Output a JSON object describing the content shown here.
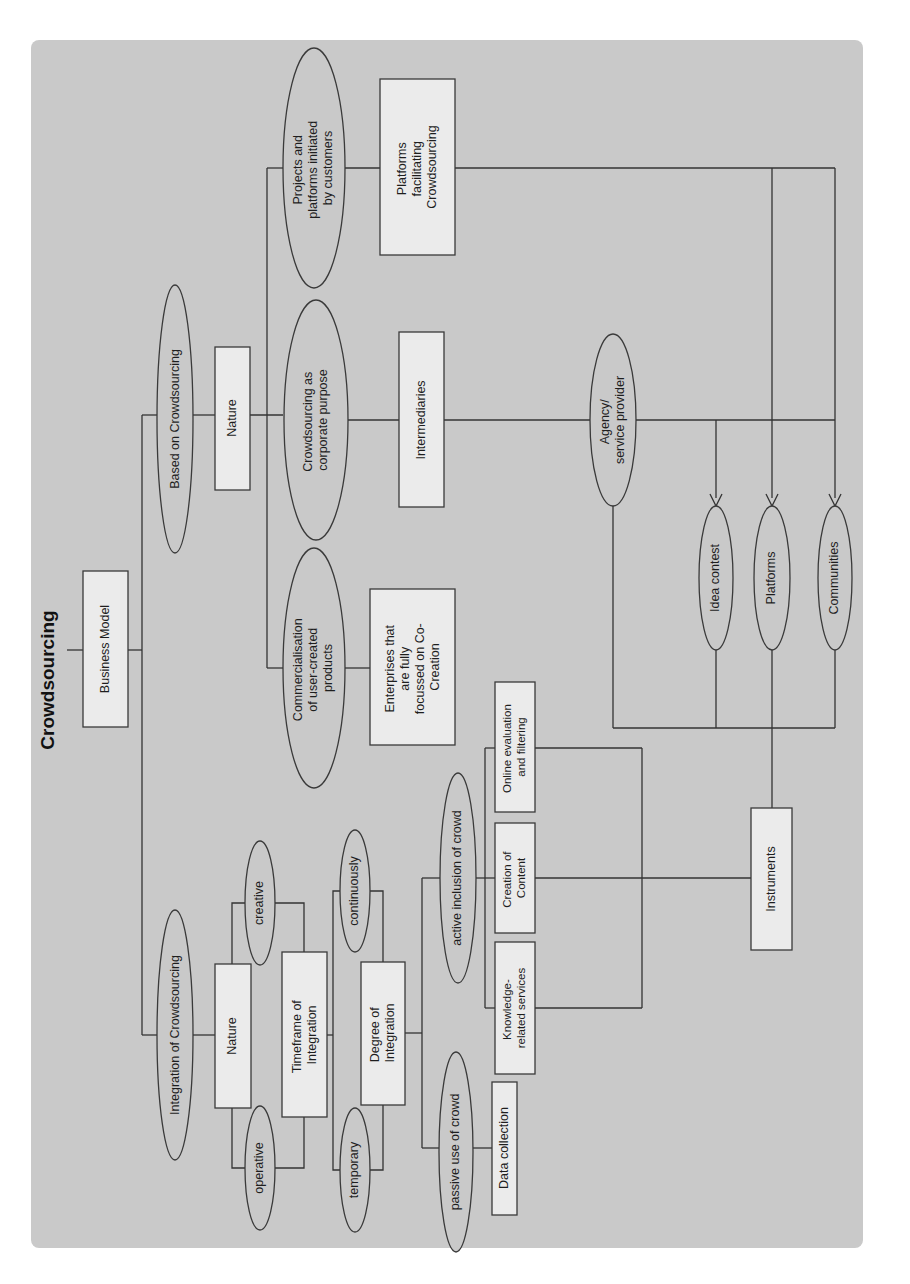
{
  "diagram": {
    "title": "Crowdsourcing",
    "orientation": "rotated 90° counter-clockwise",
    "colors": {
      "background": "#c9c9c9",
      "box_fill": "#ebebeb",
      "stroke": "#3a3a3a"
    },
    "root": {
      "label": "Business Model"
    },
    "branches": {
      "based": {
        "label": "Based on Crowdsourcing",
        "nature": {
          "label": "Nature"
        },
        "types": [
          {
            "label_lines": [
              "Projects and",
              "platforms initiated",
              "by customers"
            ],
            "child_lines": [
              "Platforms",
              "facilitating",
              "Crowdsourcing"
            ]
          },
          {
            "label_lines": [
              "Crowdsourcing as",
              "corporate purpose"
            ],
            "child_lines": [
              "Intermediaries"
            ]
          },
          {
            "label_lines": [
              "Commercialisation",
              "of user-created",
              "products"
            ],
            "child_lines": [
              "Enterprises that",
              "are fully",
              "focussed on Co-",
              "Creation"
            ]
          }
        ],
        "agency": {
          "label_lines": [
            "Agency/",
            "service provider"
          ]
        }
      },
      "integration": {
        "label": "Integration of Crowdsourcing",
        "nature": {
          "label": "Nature",
          "options": [
            "creative",
            "operative"
          ]
        },
        "timeframe": {
          "label_lines": [
            "Timeframe of",
            "Integration"
          ],
          "options": [
            "continuously",
            "temporary"
          ]
        },
        "degree": {
          "label_lines": [
            "Degree of",
            "Integration"
          ]
        },
        "active": {
          "label": "active inclusion of crowd",
          "children": [
            {
              "label_lines": [
                "Online evaluation",
                "and filtering"
              ]
            },
            {
              "label_lines": [
                "Creation of",
                "Content"
              ]
            },
            {
              "label_lines": [
                "Knowledge-",
                "related services"
              ]
            }
          ]
        },
        "passive": {
          "label": "passive use of crowd",
          "child": "Data collection"
        }
      }
    },
    "instruments": {
      "label": "Instruments",
      "items": [
        "Idea contest",
        "Platforms",
        "Communities"
      ]
    }
  }
}
